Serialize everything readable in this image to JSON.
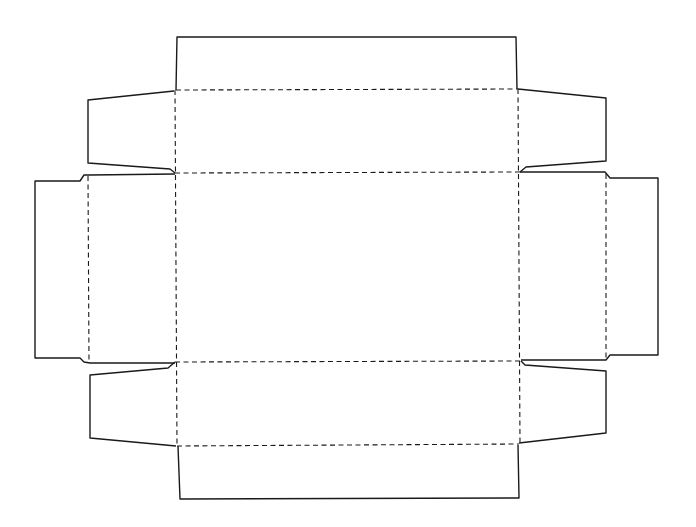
{
  "diagram": {
    "type": "box-dieline",
    "line_styles": {
      "cut_line": {
        "style": "solid",
        "color": "#1a1a1a"
      },
      "fold_line": {
        "style": "dashed",
        "color": "#1a1a1a"
      }
    },
    "panels": [
      {
        "id": "top-flap",
        "label": ""
      },
      {
        "id": "top-wall",
        "label": ""
      },
      {
        "id": "base",
        "label": ""
      },
      {
        "id": "bottom-wall",
        "label": ""
      },
      {
        "id": "bottom-flap",
        "label": ""
      },
      {
        "id": "left-wall",
        "label": ""
      },
      {
        "id": "left-flap",
        "label": ""
      },
      {
        "id": "right-wall",
        "label": ""
      },
      {
        "id": "right-flap",
        "label": ""
      },
      {
        "id": "corner-tab-top-left",
        "label": ""
      },
      {
        "id": "corner-tab-top-right",
        "label": ""
      },
      {
        "id": "corner-tab-bottom-left",
        "label": ""
      },
      {
        "id": "corner-tab-bottom-right",
        "label": ""
      }
    ]
  }
}
